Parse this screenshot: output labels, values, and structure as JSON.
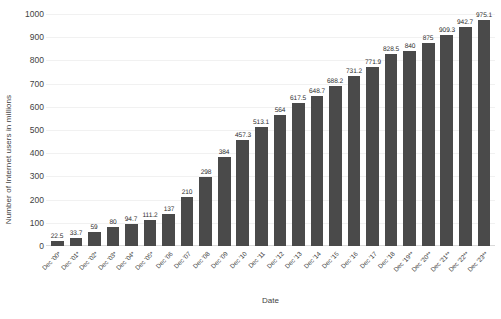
{
  "chart_data": {
    "type": "bar",
    "title": "",
    "xlabel": "Date",
    "ylabel": "Number of Internet users in millions",
    "ylim": [
      0,
      1000
    ],
    "ytick_step": 100,
    "yticks": [
      1000,
      900,
      800,
      700,
      600,
      500,
      400,
      300,
      200,
      100,
      0
    ],
    "grid": true,
    "legend": "none",
    "bar_color": "#4a4a4a",
    "categories": [
      "Dec '00*",
      "Dec '01*",
      "Dec '02*",
      "Dec '03*",
      "Dec '04*",
      "Dec '05*",
      "Dec '06",
      "Dec '07",
      "Dec '08",
      "Dec '09",
      "Dec '10",
      "Dec '11",
      "Dec '12",
      "Dec '13",
      "Dec '14",
      "Dec '15",
      "Dec '16",
      "Dec '17",
      "Dec '18",
      "Dec '19**",
      "Dec '20**",
      "Dec '21**",
      "Dec '22**",
      "Dec '23**"
    ],
    "values": [
      22.5,
      33.7,
      59,
      80,
      94.7,
      111.2,
      137,
      210,
      298,
      384,
      457.3,
      513.1,
      564,
      617.5,
      648.7,
      688.2,
      731.2,
      771.9,
      828.5,
      840,
      875,
      909.3,
      942.7,
      975.1
    ],
    "data_labels": [
      "22.5",
      "33.7",
      "59",
      "80",
      "94.7",
      "111.2",
      "137",
      "210",
      "298",
      "384",
      "457.3",
      "513.1",
      "564",
      "617.5",
      "648.7",
      "688.2",
      "731.2",
      "771.9",
      "828.5",
      "840",
      "875",
      "909.3",
      "942.7",
      "975.1"
    ]
  }
}
